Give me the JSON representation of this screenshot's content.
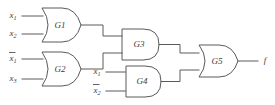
{
  "figure": {
    "background_color": "#ffffff",
    "line_color": "#5a5a5a",
    "text_color": "#3c3c3c"
  },
  "inputs": [
    {
      "id": "in-x1-g1",
      "label": "x",
      "subscript": "1",
      "negated": false,
      "display": "x1",
      "target_gate": "G1",
      "pin": "top"
    },
    {
      "id": "in-x2-g1",
      "label": "x",
      "subscript": "2",
      "negated": false,
      "display": "x2",
      "target_gate": "G1",
      "pin": "bottom"
    },
    {
      "id": "in-nx1-g2",
      "label": "x",
      "subscript": "1",
      "negated": true,
      "display": "x1'",
      "target_gate": "G2",
      "pin": "top"
    },
    {
      "id": "in-x3-g2",
      "label": "x",
      "subscript": "3",
      "negated": false,
      "display": "x3",
      "target_gate": "G2",
      "pin": "bottom"
    },
    {
      "id": "in-x1-g4",
      "label": "x",
      "subscript": "1",
      "negated": false,
      "display": "x1",
      "target_gate": "G4",
      "pin": "top"
    },
    {
      "id": "in-nx2-g4",
      "label": "x",
      "subscript": "2",
      "negated": true,
      "display": "x2'",
      "target_gate": "G4",
      "pin": "bottom"
    }
  ],
  "gates": [
    {
      "id": "G1",
      "label": "G1",
      "type": "OR",
      "inputs": [
        "x1",
        "x2"
      ],
      "output_to": "G3"
    },
    {
      "id": "G2",
      "label": "G2",
      "type": "OR",
      "inputs": [
        "x1'",
        "x3"
      ],
      "output_to": "G3"
    },
    {
      "id": "G3",
      "label": "G3",
      "type": "AND",
      "inputs": [
        "G1",
        "G2"
      ],
      "output_to": "G5"
    },
    {
      "id": "G4",
      "label": "G4",
      "type": "AND",
      "inputs": [
        "x1",
        "x2'"
      ],
      "output_to": "G5"
    },
    {
      "id": "G5",
      "label": "G5",
      "type": "OR",
      "inputs": [
        "G3",
        "G4"
      ],
      "output_to": "f"
    }
  ],
  "outputs": [
    {
      "id": "out-f",
      "label": "f",
      "source_gate": "G5"
    }
  ]
}
